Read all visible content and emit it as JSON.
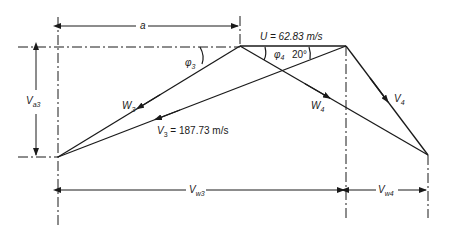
{
  "diagram": {
    "labels": {
      "a": "a",
      "U": "U = 62.83 m/s",
      "phi3": "φ",
      "phi3_sub": "3",
      "phi4": "φ",
      "phi4_sub": "4",
      "angle20": "20°",
      "Va3": "V",
      "Va3_sub": "a3",
      "W3": "W",
      "W3_sub": "3",
      "W4": "W",
      "W4_sub": "4",
      "V4": "V",
      "V4_sub": "4",
      "V3": "V",
      "V3_sub": "3",
      "V3_value": " = 187.73 m/s",
      "Vw3": "V",
      "Vw3_sub": "w3",
      "Vw4": "V",
      "Vw4_sub": "w4"
    },
    "colors": {
      "line": "#1a1a1a",
      "background": "#ffffff"
    }
  }
}
